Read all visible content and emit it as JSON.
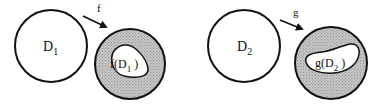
{
  "diagram": {
    "left": {
      "domain_label": "D",
      "domain_sub": "1",
      "map_label": "f",
      "image_label_prefix": "f(D",
      "image_sub": "1",
      "image_label_suffix": " )"
    },
    "right": {
      "domain_label": "D",
      "domain_sub": "2",
      "map_label": "g",
      "image_label_prefix": "g(D",
      "image_sub": "2",
      "image_label_suffix": " )"
    },
    "colors": {
      "stroke": "#111111",
      "shade": "#bdbdbd",
      "background": "#ffffff"
    }
  }
}
